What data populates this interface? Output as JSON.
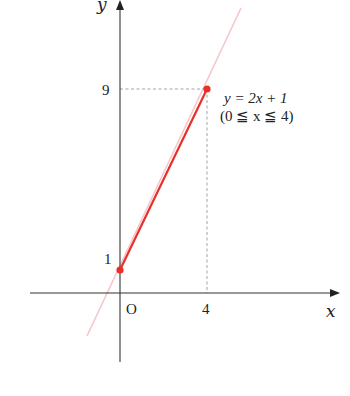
{
  "diagram": {
    "axes": {
      "x_label": "x",
      "y_label": "y",
      "origin_label": "O"
    },
    "ticks": {
      "x": [
        {
          "value": 4,
          "label": "4"
        }
      ],
      "y": [
        {
          "value": 1,
          "label": "1"
        },
        {
          "value": 9,
          "label": "9"
        }
      ]
    },
    "function": {
      "equation": "y = 2x + 1",
      "domain": "(0 ≦ x ≦ 4)",
      "start_point": {
        "x": 0,
        "y": 1
      },
      "end_point": {
        "x": 4,
        "y": 9
      }
    },
    "colors": {
      "segment": "#e8302a",
      "extended_line": "#f6c6cc",
      "axis": "#333333",
      "guide": "#999999"
    }
  }
}
